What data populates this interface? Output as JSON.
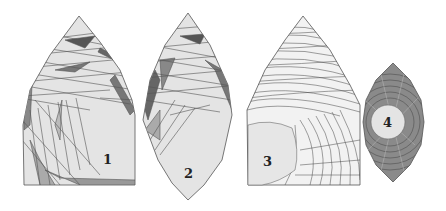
{
  "figure": {
    "panels": [
      {
        "id": "panel-1",
        "label": "1"
      },
      {
        "id": "panel-2",
        "label": "2"
      },
      {
        "id": "panel-3",
        "label": "3"
      },
      {
        "id": "panel-4",
        "label": "4"
      }
    ],
    "colors": {
      "fill_light": "#e4e4e4",
      "fill_mid": "#a8a8a8",
      "fill_dark": "#6a6a6a",
      "stroke": "#555555"
    }
  }
}
